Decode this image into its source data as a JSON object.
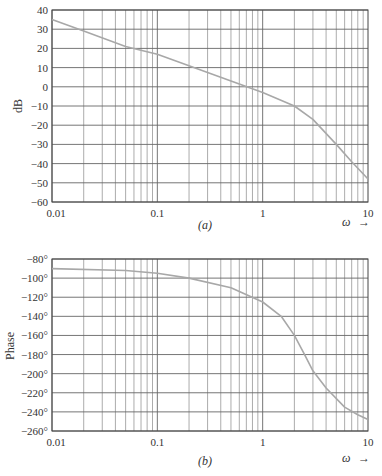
{
  "chart_data": [
    {
      "type": "line",
      "panel_label": "(a)",
      "title": "",
      "xlabel": "ω",
      "ylabel": "dB",
      "xscale": "log",
      "xlim": [
        0.01,
        10
      ],
      "ylim": [
        -60,
        40
      ],
      "x_tick_labels": [
        "0.01",
        "0.1",
        "1",
        "10"
      ],
      "y_tick_labels": [
        "40",
        "30",
        "20",
        "10",
        "0",
        "-10",
        "-20",
        "-30",
        "-40",
        "-50",
        "-60"
      ],
      "grid": true,
      "series": [
        {
          "name": "magnitude",
          "x": [
            0.01,
            0.02,
            0.05,
            0.1,
            0.2,
            0.5,
            1,
            2,
            3,
            5,
            7,
            10
          ],
          "values": [
            35,
            29,
            21,
            17,
            11,
            3,
            -3,
            -10,
            -17,
            -30,
            -39,
            -48
          ]
        }
      ]
    },
    {
      "type": "line",
      "panel_label": "(b)",
      "title": "",
      "xlabel": "ω",
      "ylabel": "Phase",
      "xscale": "log",
      "xlim": [
        0.01,
        10
      ],
      "ylim": [
        -260,
        -80
      ],
      "x_tick_labels": [
        "0.01",
        "0.1",
        "1",
        "10"
      ],
      "y_tick_labels": [
        "-80°",
        "-100°",
        "-120°",
        "-140°",
        "-160°",
        "-180°",
        "-200°",
        "-220°",
        "-240°",
        "-260°"
      ],
      "grid": true,
      "series": [
        {
          "name": "phase",
          "x": [
            0.01,
            0.05,
            0.1,
            0.2,
            0.5,
            1,
            1.5,
            2,
            2.5,
            3,
            4,
            6,
            8,
            10
          ],
          "values": [
            -90,
            -92,
            -95,
            -100,
            -110,
            -125,
            -140,
            -160,
            -180,
            -197,
            -215,
            -235,
            -243,
            -248
          ]
        }
      ]
    }
  ],
  "labels": {
    "a_ylabel": "dB",
    "b_ylabel": "Phase",
    "a_panel": "(a)",
    "b_panel": "(b)",
    "omega": "ω",
    "arrow": "→"
  }
}
